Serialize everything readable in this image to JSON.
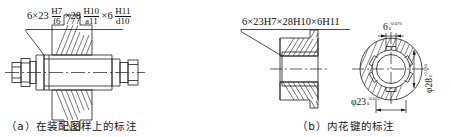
{
  "figure": {
    "kind": "engineering-drawing",
    "panels": [
      {
        "id": "a",
        "caption": "（a）在装配图样上的标注",
        "caption_label": "(a)",
        "annotation": {
          "parts": [
            {
              "type": "plain",
              "text": "6×23"
            },
            {
              "type": "fraction",
              "numerator": "H7",
              "denominator": "f6"
            },
            {
              "type": "plain",
              "text": "×28"
            },
            {
              "type": "fraction",
              "numerator": "H10",
              "denominator": "a11"
            },
            {
              "type": "plain",
              "text": "×6"
            },
            {
              "type": "fraction",
              "numerator": "H11",
              "denominator": "d10"
            }
          ],
          "flat_text": "6×23 H7/f6 ×28 H10/a11 ×6 H11/d10"
        },
        "view": "splined-shaft-in-assembly-section"
      },
      {
        "id": "b",
        "caption": "（b）内花键的标注",
        "caption_label": "(b)",
        "annotation": {
          "flat_text": "6×23H7×28H10×6H11"
        },
        "views": [
          {
            "name": "hub-section-view"
          },
          {
            "name": "hub-end-circular-view"
          }
        ],
        "dimensions": [
          {
            "name": "spline-width",
            "symbol": "",
            "value": "6",
            "upper_tolerance": "+0.076",
            "lower_tolerance": "0",
            "orientation": "horizontal"
          },
          {
            "name": "major-diameter",
            "symbol": "φ",
            "value": "28",
            "upper_tolerance": "+0.084",
            "lower_tolerance": "0",
            "orientation": "vertical"
          },
          {
            "name": "minor-diameter",
            "symbol": "φ",
            "value": "23",
            "upper_tolerance": "+0.021",
            "lower_tolerance": "0",
            "orientation": "horizontal"
          }
        ]
      }
    ]
  },
  "colors": {
    "line": "#1a1a1a",
    "text": "#111111",
    "background": "#ffffff"
  }
}
